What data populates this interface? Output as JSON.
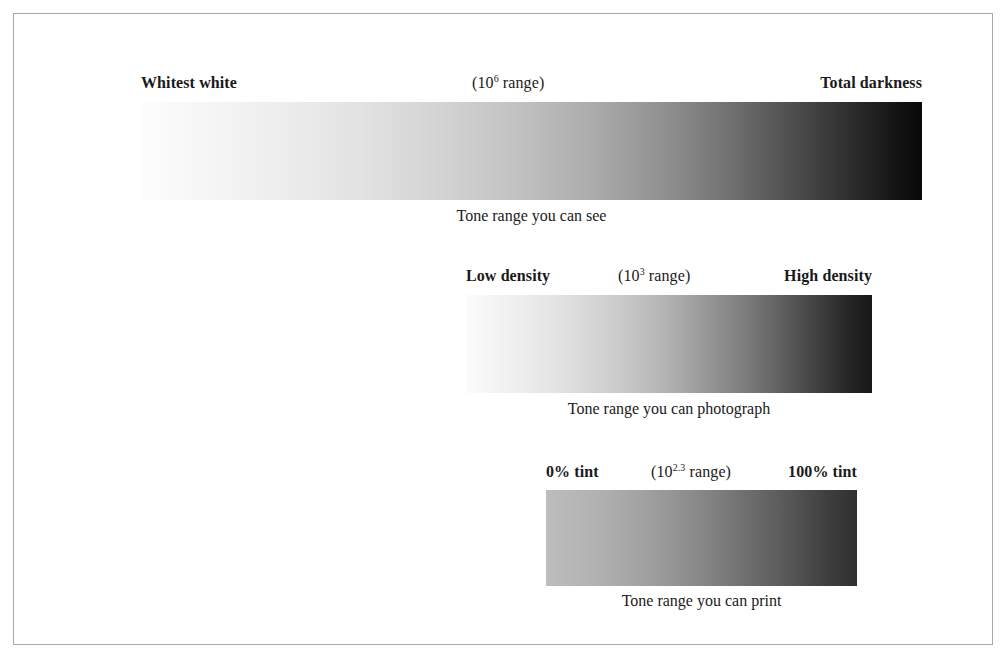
{
  "figure": {
    "frame_border_color": "#a8a8a8",
    "background_color": "#ffffff",
    "text_color": "#1a1a1a"
  },
  "blocks": [
    {
      "id": "see",
      "label_left": "Whitest white",
      "label_mid_prefix": "(10",
      "label_mid_exponent": "6",
      "label_mid_suffix": " range)",
      "label_right": "Total darkness",
      "caption": "Tone range you can see",
      "gradient_start_color": "#fdfdfd",
      "gradient_end_color": "#090909"
    },
    {
      "id": "photograph",
      "label_left": "Low density",
      "label_mid_prefix": "(10",
      "label_mid_exponent": "3",
      "label_mid_suffix": " range)",
      "label_right": "High density",
      "caption": "Tone range you can photograph",
      "gradient_start_color": "#fbfbfb",
      "gradient_end_color": "#181818"
    },
    {
      "id": "print",
      "label_left": "0% tint",
      "label_mid_prefix": "(10",
      "label_mid_exponent": "2.3",
      "label_mid_suffix": " range)",
      "label_right": "100% tint",
      "caption": "Tone range you can print",
      "gradient_start_color": "#bdbdbd",
      "gradient_end_color": "#303030"
    }
  ]
}
